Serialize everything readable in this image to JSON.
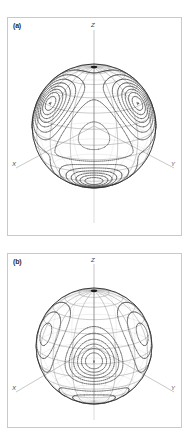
{
  "figure": {
    "background_color": "#ffffff",
    "frame_color": "#c9c9c9",
    "mesh_color": "#8a8a8a",
    "contour_color": "#3a3a3a",
    "axis_color": "#b0b0b0",
    "pole_marker_color": "#1a1a1a"
  },
  "panels": [
    {
      "id": "panel-a",
      "label": "(a)",
      "axes": {
        "x": "X",
        "y": "Y",
        "z": "Z"
      },
      "description": "Sphere with latitude-longitude mesh and overlaid contour map"
    },
    {
      "id": "panel-b",
      "label": "(b)",
      "axes": {
        "x": "X",
        "y": "Y",
        "z": "Z"
      },
      "description": "Sphere with latitude-longitude mesh and overlaid contour map"
    }
  ],
  "chart_data": [
    {
      "type": "contour",
      "panel": "(a)",
      "title": "",
      "xlabel": "X",
      "ylabel": "Y",
      "zlabel": "Z",
      "projection": "3d-sphere",
      "grid": true,
      "legend": "none",
      "mesh": {
        "latitude_lines": 13,
        "longitude_lines": 16
      },
      "contour_levels": [
        -0.8,
        -0.6,
        -0.4,
        -0.2,
        0.2,
        0.4,
        0.6,
        0.8,
        1.0
      ],
      "negative_linestyle": "dashed",
      "positive_linestyle": "solid",
      "extrema": [
        {
          "label": "max",
          "lon_deg": -55,
          "lat_deg": 32,
          "value": 1.0
        },
        {
          "label": "max",
          "lon_deg": 55,
          "lat_deg": 32,
          "value": 1.0
        },
        {
          "label": "max",
          "lon_deg": 0,
          "lat_deg": -42,
          "value": 1.0
        },
        {
          "label": "min",
          "lon_deg": 0,
          "lat_deg": 5,
          "value": -0.6
        }
      ]
    },
    {
      "type": "contour",
      "panel": "(b)",
      "title": "",
      "xlabel": "X",
      "ylabel": "Y",
      "zlabel": "Z",
      "projection": "3d-sphere",
      "grid": true,
      "legend": "none",
      "mesh": {
        "latitude_lines": 13,
        "longitude_lines": 16
      },
      "contour_levels": [
        -0.8,
        -0.6,
        -0.4,
        -0.2,
        0.2,
        0.4,
        0.6,
        0.8,
        1.0
      ],
      "negative_linestyle": "dashed",
      "positive_linestyle": "solid",
      "extrema": [
        {
          "label": "max",
          "lon_deg": 0,
          "lat_deg": 0,
          "value": 1.0
        },
        {
          "label": "min",
          "lon_deg": -62,
          "lat_deg": 20,
          "value": -0.7
        },
        {
          "label": "min",
          "lon_deg": 62,
          "lat_deg": 20,
          "value": -0.7
        },
        {
          "label": "min",
          "lon_deg": 0,
          "lat_deg": -48,
          "value": -0.7
        }
      ]
    }
  ]
}
